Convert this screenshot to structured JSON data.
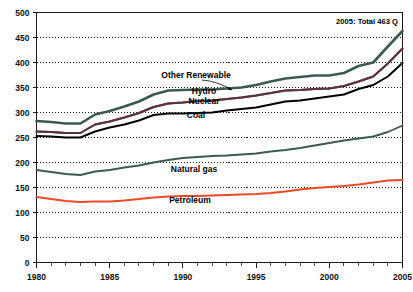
{
  "chart_data": {
    "type": "line",
    "title": "",
    "subtitle": "",
    "xlabel": "",
    "ylabel": "",
    "xlim": [
      1980,
      2005
    ],
    "ylim": [
      0,
      500
    ],
    "grid": true,
    "grid_axis": "y",
    "legend_position": "inline-labels",
    "y_ticks": [
      0,
      50,
      100,
      150,
      200,
      250,
      300,
      350,
      400,
      450,
      500
    ],
    "x_ticks": [
      1980,
      1985,
      1990,
      1995,
      2000,
      2005
    ],
    "x_minor_tick_step": 1,
    "x": [
      1980,
      1981,
      1982,
      1983,
      1984,
      1985,
      1986,
      1987,
      1988,
      1989,
      1990,
      1991,
      1992,
      1993,
      1994,
      1995,
      1996,
      1997,
      1998,
      1999,
      2000,
      2001,
      2002,
      2003,
      2004,
      2005
    ],
    "annotations": [
      {
        "name": "total-annotation",
        "text": "2005: Total 463 Q",
        "x_px": 398,
        "y_px": 24,
        "anchor": "end"
      }
    ],
    "series": [
      {
        "name": "Other Renewable",
        "color": "#3d5a52",
        "width": 2.6,
        "label_x_px": 196,
        "label_y_px": 78,
        "leader": {
          "x1": 202,
          "y1": 80,
          "x2": 232,
          "y2": 90
        },
        "values": [
          283,
          281,
          278,
          278,
          296,
          303,
          312,
          322,
          336,
          344,
          345,
          346,
          346,
          348,
          350,
          355,
          362,
          368,
          371,
          374,
          374,
          379,
          393,
          400,
          432,
          463
        ]
      },
      {
        "name": "Hydro",
        "color": "#5a3340",
        "width": 1.9,
        "label_x_px": 204,
        "label_y_px": 94,
        "leader": null,
        "values": [
          262,
          261,
          259,
          259,
          276,
          282,
          290,
          299,
          311,
          318,
          320,
          323,
          324,
          327,
          330,
          334,
          339,
          344,
          345,
          347,
          348,
          353,
          362,
          372,
          398,
          428
        ]
      },
      {
        "name": "Nuclear",
        "color": "#5a3340",
        "width": 1.9,
        "label_x_px": 204,
        "label_y_px": 104,
        "leader": null,
        "values": [
          262,
          261,
          259,
          259,
          276,
          282,
          290,
          299,
          311,
          318,
          320,
          323,
          324,
          327,
          330,
          334,
          339,
          344,
          345,
          347,
          348,
          353,
          362,
          372,
          398,
          428
        ]
      },
      {
        "name": "Coal",
        "color": "#000000",
        "width": 2.0,
        "label_x_px": 196,
        "label_y_px": 118,
        "leader": null,
        "values": [
          253,
          252,
          250,
          250,
          262,
          270,
          276,
          284,
          295,
          298,
          298,
          299,
          300,
          304,
          307,
          310,
          316,
          322,
          324,
          328,
          332,
          336,
          347,
          355,
          372,
          399
        ]
      },
      {
        "name": "Natural gas",
        "color": "#3d5a52",
        "width": 1.9,
        "label_x_px": 194,
        "label_y_px": 172,
        "leader": null,
        "values": [
          185,
          181,
          177,
          175,
          182,
          185,
          190,
          194,
          200,
          205,
          209,
          211,
          213,
          214,
          216,
          218,
          222,
          225,
          229,
          234,
          239,
          244,
          248,
          252,
          261,
          274
        ]
      },
      {
        "name": "Petroleum",
        "color": "#ee4a25",
        "width": 2.1,
        "label_x_px": 190,
        "label_y_px": 203,
        "leader": null,
        "values": [
          131,
          127,
          123,
          121,
          122,
          122,
          124,
          127,
          130,
          132,
          133,
          133,
          134,
          135,
          136,
          137,
          139,
          142,
          146,
          149,
          151,
          153,
          156,
          160,
          164,
          165
        ]
      }
    ]
  },
  "axes": {
    "y_tick_labels": [
      "500",
      "450",
      "400",
      "350",
      "300",
      "250",
      "200",
      "150",
      "100",
      "50",
      "0"
    ],
    "x_tick_labels": [
      "1980",
      "1985",
      "1990",
      "1995",
      "2000",
      "2005"
    ]
  },
  "series_labels": {
    "other_renewable": "Other Renewable",
    "hydro": "Hydro",
    "nuclear": "Nuclear",
    "coal": "Coal",
    "natural_gas": "Natural gas",
    "petroleum": "Petroleum"
  }
}
